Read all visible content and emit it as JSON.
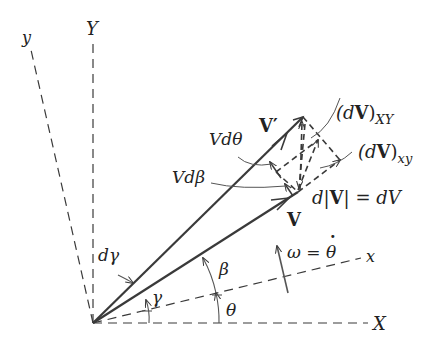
{
  "diagram": {
    "type": "vector kinematics diagram",
    "colors": {
      "line": "#3a3a3a",
      "text": "#222222",
      "background": "#ffffff"
    },
    "axes": {
      "Y": "Y",
      "X": "X",
      "y": "y",
      "x": "x"
    },
    "vectors": {
      "V": "V",
      "V_prime": "V′"
    },
    "labels": {
      "V_dtheta": "Vdθ",
      "V_dbeta": "Vdβ",
      "dV_XY_open": "(d",
      "dV_XY_bold": "V",
      "dV_XY_close": ")",
      "dV_XY_sub": "XY",
      "dV_xy_open": "(d",
      "dV_xy_bold": "V",
      "dV_xy_close": ")",
      "dV_xy_sub": "xy",
      "dmagV_d": "d",
      "dmagV_bar1": "|",
      "dmagV_bold": "V",
      "dmagV_bar2": "|",
      "dmagV_eq": " = dV",
      "omega_lhs": "ω = ",
      "omega_rhs": "θ",
      "omega_dot": "·",
      "d_gamma": "dγ",
      "gamma": "γ",
      "beta": "β",
      "theta": "θ"
    }
  }
}
